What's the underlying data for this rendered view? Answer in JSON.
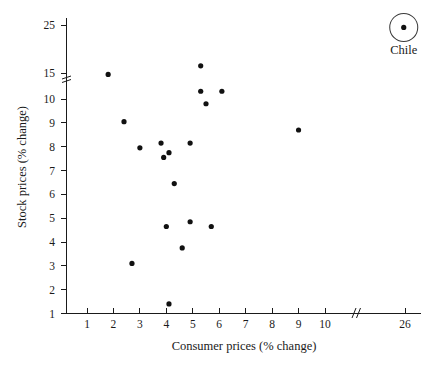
{
  "chart_data": {
    "type": "scatter",
    "title": "",
    "xlabel": "Consumer prices (% change)",
    "ylabel": "Stock prices (% change)",
    "grid": false,
    "legend": "none",
    "xlim": [
      0.2,
      26.8
    ],
    "ylim": [
      0.7,
      26.0
    ],
    "x_ticks": [
      "1",
      "2",
      "3",
      "4",
      "5",
      "6",
      "7",
      "8",
      "9",
      "10",
      "26"
    ],
    "x_tick_values": [
      1,
      2,
      3,
      4,
      5,
      6,
      7,
      8,
      9,
      10,
      26
    ],
    "y_ticks": [
      "1",
      "2",
      "3",
      "4",
      "5",
      "6",
      "7",
      "8",
      "9",
      "10",
      "15",
      "25"
    ],
    "y_tick_values": [
      1,
      2,
      3,
      4,
      5,
      6,
      7,
      8,
      9,
      10,
      15,
      25
    ],
    "axis_break": {
      "x_axis_between": [
        10,
        26
      ],
      "y_axis_between": [
        10,
        15
      ],
      "symbol": "//"
    },
    "points": [
      {
        "x": 1.8,
        "y": 14.7,
        "label": ""
      },
      {
        "x": 2.4,
        "y": 9.05,
        "label": ""
      },
      {
        "x": 2.7,
        "y": 3.1,
        "label": ""
      },
      {
        "x": 3.0,
        "y": 7.95,
        "label": ""
      },
      {
        "x": 3.8,
        "y": 8.15,
        "label": ""
      },
      {
        "x": 3.9,
        "y": 7.55,
        "label": ""
      },
      {
        "x": 4.0,
        "y": 4.65,
        "label": ""
      },
      {
        "x": 4.1,
        "y": 7.75,
        "label": ""
      },
      {
        "x": 4.1,
        "y": 1.4,
        "label": ""
      },
      {
        "x": 4.3,
        "y": 6.45,
        "label": ""
      },
      {
        "x": 4.6,
        "y": 3.75,
        "label": ""
      },
      {
        "x": 4.9,
        "y": 8.15,
        "label": ""
      },
      {
        "x": 4.9,
        "y": 4.85,
        "label": ""
      },
      {
        "x": 5.3,
        "y": 16.5,
        "label": ""
      },
      {
        "x": 5.3,
        "y": 11.2,
        "label": ""
      },
      {
        "x": 5.5,
        "y": 9.8,
        "label": ""
      },
      {
        "x": 5.7,
        "y": 4.65,
        "label": ""
      },
      {
        "x": 6.1,
        "y": 11.2,
        "label": ""
      },
      {
        "x": 9.0,
        "y": 8.7,
        "label": ""
      },
      {
        "x": 25.7,
        "y": 24.5,
        "label": "Chile",
        "highlighted": true
      }
    ],
    "annotations": [
      {
        "text": "Chile",
        "x": 25.7,
        "y": 24.5
      }
    ],
    "colors": {
      "point": "#111111",
      "axis": "#1a1a1a",
      "background": "#ffffff",
      "highlight_ring": "#3a3a3a"
    }
  }
}
